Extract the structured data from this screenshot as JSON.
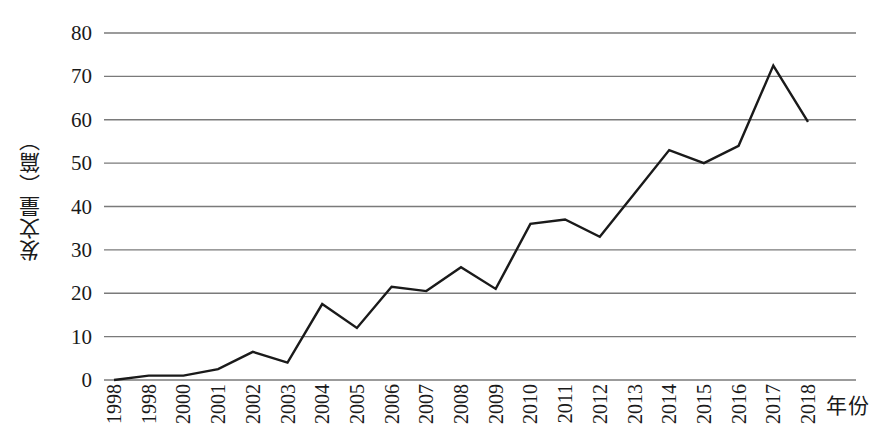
{
  "chart_data": {
    "type": "line",
    "title": "",
    "xlabel": "年份",
    "ylabel": "发文量（篇）",
    "categories": [
      "1998",
      "1998",
      "2000",
      "2001",
      "2002",
      "2003",
      "2004",
      "2005",
      "2006",
      "2007",
      "2008",
      "2009",
      "2010",
      "2011",
      "2012",
      "2013",
      "2014",
      "2015",
      "2016",
      "2017",
      "2018"
    ],
    "values": [
      0,
      1,
      1,
      2.5,
      6.5,
      4,
      17.5,
      12,
      21.5,
      20.5,
      26,
      21,
      36,
      37,
      33,
      43,
      53,
      50,
      54,
      72.5,
      59.5
    ],
    "series": [
      {
        "name": "发文量",
        "values": [
          0,
          1,
          1,
          2.5,
          6.5,
          4,
          17.5,
          12,
          21.5,
          20.5,
          26,
          21,
          36,
          37,
          33,
          43,
          53,
          50,
          54,
          72.5,
          59.5
        ]
      }
    ],
    "ylim": [
      0,
      80
    ],
    "yticks": [
      0,
      10,
      20,
      30,
      40,
      50,
      60,
      70,
      80
    ],
    "ytick_labels": [
      "0",
      "10",
      "20",
      "30",
      "40",
      "50",
      "60",
      "70",
      "80"
    ],
    "grid": "horizontal",
    "legend": "none",
    "line_color": "#1a1a1a",
    "grid_color": "#7a7a7a",
    "markers": false
  }
}
